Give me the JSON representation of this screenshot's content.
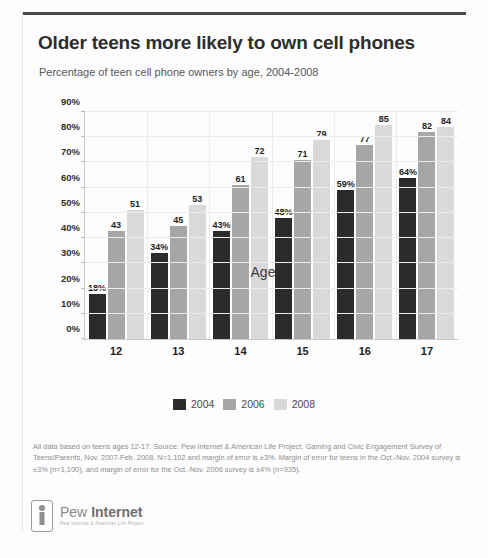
{
  "header": {
    "title": "Older teens more likely to own cell phones",
    "subtitle": "Percentage of teen cell phone owners by age, 2004-2008"
  },
  "chart_data": {
    "type": "bar",
    "title": "Older teens more likely to own cell phones",
    "subtitle": "Percentage of teen cell phone owners by age, 2004-2008",
    "xlabel": "Age",
    "ylabel": "",
    "ylim": [
      0,
      90
    ],
    "ytick_values": [
      0,
      10,
      20,
      30,
      40,
      50,
      60,
      70,
      80,
      90
    ],
    "ytick_labels": [
      "0%",
      "10%",
      "20%",
      "30%",
      "40%",
      "50%",
      "60%",
      "70%",
      "80%",
      "90%"
    ],
    "grid": true,
    "legend_position": "bottom",
    "categories": [
      "12",
      "13",
      "14",
      "15",
      "16",
      "17"
    ],
    "series": [
      {
        "name": "2004",
        "color": "#2b2b2b",
        "values": [
          18,
          34,
          43,
          48,
          59,
          64
        ],
        "labels": [
          "18%",
          "34%",
          "43%",
          "48%",
          "59%",
          "64%"
        ]
      },
      {
        "name": "2006",
        "color": "#a6a6a6",
        "values": [
          43,
          45,
          61,
          71,
          77,
          82
        ],
        "labels": [
          "43",
          "45",
          "61",
          "71",
          "77",
          "82"
        ]
      },
      {
        "name": "2008",
        "color": "#d9d9d9",
        "values": [
          51,
          53,
          72,
          79,
          85,
          84
        ],
        "labels": [
          "51",
          "53",
          "72",
          "79",
          "85",
          "84"
        ]
      }
    ]
  },
  "footnote": "All data based on teens ages 12-17. Source: Pew Internet & American Life Project, Gaming and Civic Engagement Survey of Teens/Parents, Nov. 2007-Feb. 2008. N=1,102 and margin of error is ±3%. Margin of error for teens in the Oct.-Nov. 2004 survey is ±3% (n=1,100), and margin of error for the Oct.-Nov. 2006 survey is ±4% (n=935).",
  "logo": {
    "name_light": "Pew",
    "name_bold": "Internet",
    "tagline": "Pew Internet & American Life Project"
  }
}
